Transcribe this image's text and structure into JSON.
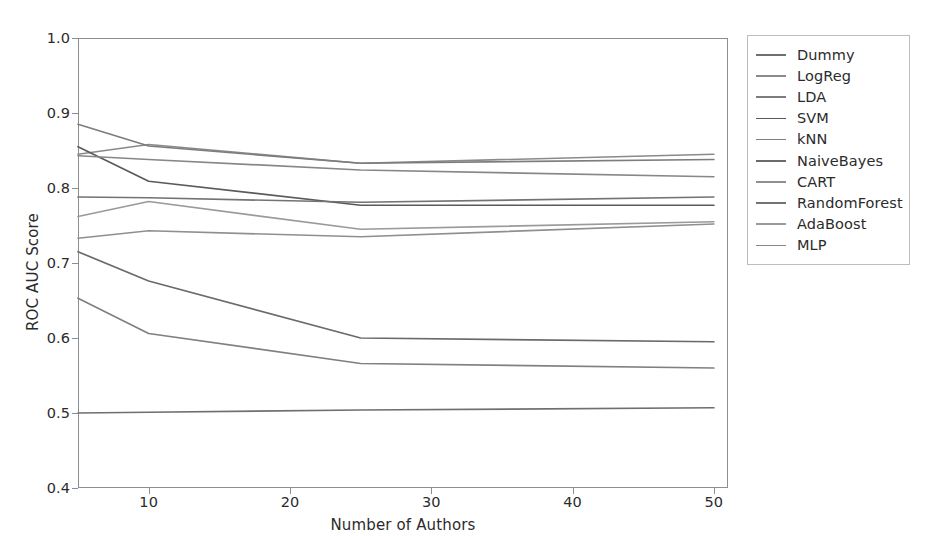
{
  "chart_data": {
    "type": "line",
    "title": "",
    "xlabel": "Number of Authors",
    "ylabel": "ROC AUC Score",
    "x": [
      5,
      10,
      25,
      50
    ],
    "xlim": [
      5,
      51
    ],
    "ylim": [
      0.4,
      1.0
    ],
    "xticks": [
      10,
      20,
      30,
      40,
      50
    ],
    "xtick_labels": [
      "10",
      "20",
      "30",
      "40",
      "50"
    ],
    "yticks": [
      0.4,
      0.5,
      0.6,
      0.7,
      0.8,
      0.9,
      1.0
    ],
    "ytick_labels": [
      "0.4",
      "0.5",
      "0.6",
      "0.7",
      "0.8",
      "0.9",
      "1.0"
    ],
    "grid": false,
    "legend_position": "right-outside",
    "series": [
      {
        "name": "Dummy",
        "color": "#6f6f6f",
        "values": [
          0.5,
          0.501,
          0.504,
          0.507
        ]
      },
      {
        "name": "LogReg",
        "color": "#8a8a8a",
        "values": [
          0.845,
          0.858,
          0.833,
          0.845
        ]
      },
      {
        "name": "LDA",
        "color": "#7d7d7d",
        "values": [
          0.885,
          0.856,
          0.833,
          0.838
        ]
      },
      {
        "name": "SVM",
        "color": "#5a5a5a",
        "values": [
          0.855,
          0.809,
          0.777,
          0.777
        ]
      },
      {
        "name": "kNN",
        "color": "#808080",
        "values": [
          0.653,
          0.606,
          0.566,
          0.56
        ]
      },
      {
        "name": "NaiveBayes",
        "color": "#6a6a6a",
        "values": [
          0.715,
          0.676,
          0.6,
          0.595
        ]
      },
      {
        "name": "CART",
        "color": "#8f8f8f",
        "values": [
          0.733,
          0.743,
          0.735,
          0.752
        ]
      },
      {
        "name": "RandomForest",
        "color": "#737373",
        "values": [
          0.788,
          0.787,
          0.781,
          0.788
        ]
      },
      {
        "name": "AdaBoost",
        "color": "#9a9a9a",
        "values": [
          0.762,
          0.782,
          0.745,
          0.755
        ]
      },
      {
        "name": "MLP",
        "color": "#878787",
        "values": [
          0.843,
          0.838,
          0.824,
          0.815
        ]
      }
    ]
  },
  "axis": {
    "frame_color": "#8e8e8e"
  }
}
